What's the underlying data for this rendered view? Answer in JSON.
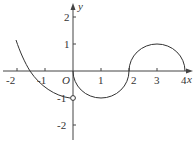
{
  "figure": {
    "type": "function-graph",
    "axes": {
      "x_label": "x",
      "y_label": "y",
      "origin_label": "O",
      "x_ticks": [
        "-2",
        "-1",
        "1",
        "2",
        "3",
        "4"
      ],
      "y_ticks": [
        "2",
        "1",
        "-1",
        "-2"
      ]
    },
    "pieces": [
      {
        "name": "left-curve",
        "description": "decreasing curve from about (-2.1, 1.2) through (-1.6, 0) to open point (0, -1)"
      },
      {
        "name": "lower-semicircle",
        "description": "lower half circle centered (1, 0), radius 1, from (0,0) to (2,0)"
      },
      {
        "name": "upper-semicircle",
        "description": "upper half circle centered (3, 0), radius 1, from (2,0) to (4,0)"
      }
    ],
    "open_point": {
      "x": 0,
      "y": -1
    }
  },
  "colors": {
    "curve": "#333333",
    "axis": "#333333"
  }
}
